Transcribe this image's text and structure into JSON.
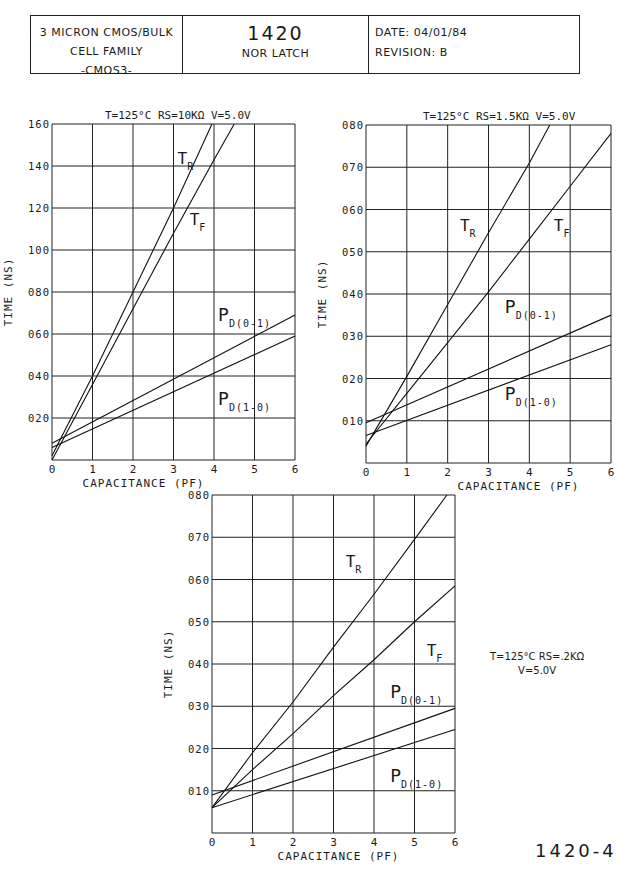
{
  "title_block": {
    "left_line1": "3 MICRON CMOS/BULK",
    "left_line2": "CELL FAMILY",
    "left_line3": "-CMOS3-",
    "cell_number": "1420",
    "cell_name": "NOR LATCH",
    "date_label": "DATE:",
    "date_value": "04/01/84",
    "revision_label": "REVISION:",
    "revision_value": "B"
  },
  "page_code": "1420-4",
  "chart3_condition_line1": "T=125°C RS=.2KΩ",
  "chart3_condition_line2": "V=5.0V",
  "chart_data": [
    {
      "type": "line",
      "title": "T=125°C RS=10KΩ V=5.0V",
      "xlabel": "CAPACITANCE (PF)",
      "ylabel": "TIME (NS)",
      "xlim": [
        0,
        6
      ],
      "ylim": [
        0,
        160
      ],
      "xticks": [
        "0",
        "1",
        "2",
        "3",
        "4",
        "5",
        "6"
      ],
      "yticks": [
        "",
        "020",
        "040",
        "060",
        "080",
        "100",
        "120",
        "140",
        "160"
      ],
      "grid": true,
      "series": [
        {
          "name": "TR",
          "x": [
            0,
            1,
            2,
            3,
            3.95
          ],
          "y": [
            2,
            40,
            80,
            120,
            160
          ]
        },
        {
          "name": "TF",
          "x": [
            0,
            1,
            2,
            3,
            4,
            4.5
          ],
          "y": [
            0,
            36,
            72,
            108,
            143,
            160
          ]
        },
        {
          "name": "PD(0-1)",
          "x": [
            0,
            6
          ],
          "y": [
            8,
            69
          ]
        },
        {
          "name": "PD(1-0)",
          "x": [
            0,
            6
          ],
          "y": [
            6,
            59
          ]
        }
      ]
    },
    {
      "type": "line",
      "title": "T=125°C RS=1.5KΩ V=5.0V",
      "xlabel": "CAPACITANCE (PF)",
      "ylabel": "TIME (NS)",
      "xlim": [
        0,
        6
      ],
      "ylim": [
        0,
        80
      ],
      "xticks": [
        "0",
        "1",
        "2",
        "3",
        "4",
        "5",
        "6"
      ],
      "yticks": [
        "",
        "010",
        "020",
        "030",
        "040",
        "050",
        "060",
        "070",
        "080"
      ],
      "grid": true,
      "series": [
        {
          "name": "TR",
          "x": [
            0,
            1,
            2,
            3,
            4,
            4.5
          ],
          "y": [
            4,
            20.5,
            37.5,
            54.5,
            71,
            80
          ]
        },
        {
          "name": "TF",
          "x": [
            0,
            1,
            2,
            3,
            4,
            5,
            6
          ],
          "y": [
            4.5,
            16.5,
            28.5,
            40.5,
            53,
            65.5,
            78
          ]
        },
        {
          "name": "PD(0-1)",
          "x": [
            0,
            6
          ],
          "y": [
            9.5,
            35
          ]
        },
        {
          "name": "PD(1-0)",
          "x": [
            0,
            6
          ],
          "y": [
            6.5,
            28
          ]
        }
      ]
    },
    {
      "type": "line",
      "title": "T=125°C RS=.2KΩ V=5.0V",
      "xlabel": "CAPACITANCE (PF)",
      "ylabel": "TIME (NS)",
      "xlim": [
        0,
        6
      ],
      "ylim": [
        0,
        80
      ],
      "xticks": [
        "0",
        "1",
        "2",
        "3",
        "4",
        "5",
        "6"
      ],
      "yticks": [
        "",
        "010",
        "020",
        "030",
        "040",
        "050",
        "060",
        "070",
        "080"
      ],
      "grid": true,
      "series": [
        {
          "name": "TR",
          "x": [
            0,
            1,
            2,
            3,
            4,
            5,
            5.8
          ],
          "y": [
            6,
            19,
            31,
            44,
            56.5,
            69.5,
            80
          ]
        },
        {
          "name": "TF",
          "x": [
            0,
            1,
            2,
            3,
            4,
            5,
            6
          ],
          "y": [
            6,
            15,
            23.5,
            32.5,
            41,
            50,
            58.5
          ]
        },
        {
          "name": "PD(0-1)",
          "x": [
            0,
            6
          ],
          "y": [
            9,
            29.5
          ]
        },
        {
          "name": "PD(1-0)",
          "x": [
            0,
            6
          ],
          "y": [
            6,
            24.5
          ]
        }
      ]
    }
  ],
  "chart_layout": [
    {
      "x0": 52,
      "x1": 295,
      "y0": 460,
      "y1": 124,
      "title_x": 105,
      "title_y": 119,
      "labels": [
        {
          "text": "T",
          "sub": "R",
          "cx": 3.1,
          "cy": 141,
          "size": 16
        },
        {
          "text": "T",
          "sub": "F",
          "cx": 3.4,
          "cy": 112,
          "size": 16
        },
        {
          "text": "P",
          "sub": "D(0-1)",
          "cx": 4.1,
          "cy": 66,
          "size": 18
        },
        {
          "text": "P",
          "sub": "D(1-0)",
          "cx": 4.1,
          "cy": 26,
          "size": 18
        }
      ]
    },
    {
      "x0": 366,
      "x1": 611,
      "y0": 463,
      "y1": 125,
      "title_x": 423,
      "title_y": 120,
      "labels": [
        {
          "text": "T",
          "sub": "R",
          "cx": 2.3,
          "cy": 55,
          "size": 16
        },
        {
          "text": "T",
          "sub": "F",
          "cx": 4.6,
          "cy": 55,
          "size": 16
        },
        {
          "text": "P",
          "sub": "D(0-1)",
          "cx": 3.4,
          "cy": 35.5,
          "size": 18
        },
        {
          "text": "P",
          "sub": "D(1-0)",
          "cx": 3.4,
          "cy": 15,
          "size": 18
        }
      ]
    },
    {
      "x0": 212,
      "x1": 455,
      "y0": 833,
      "y1": 495,
      "title_x": null,
      "title_y": null,
      "labels": [
        {
          "text": "T",
          "sub": "R",
          "cx": 3.3,
          "cy": 63,
          "size": 16
        },
        {
          "text": "T",
          "sub": "F",
          "cx": 5.3,
          "cy": 42,
          "size": 16
        },
        {
          "text": "P",
          "sub": "D(0-1)",
          "cx": 4.4,
          "cy": 32,
          "size": 18
        },
        {
          "text": "P",
          "sub": "D(1-0)",
          "cx": 4.4,
          "cy": 12,
          "size": 18
        }
      ]
    }
  ]
}
